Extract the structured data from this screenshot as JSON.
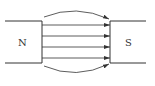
{
  "diagram": {
    "left_pole": {
      "label": "N"
    },
    "right_pole": {
      "label": "S"
    },
    "field_lines": {
      "straight_count": 4,
      "curved_count": 2,
      "direction": "N to S"
    },
    "colors": {
      "line": "#333333",
      "background": "#ffffff"
    }
  }
}
